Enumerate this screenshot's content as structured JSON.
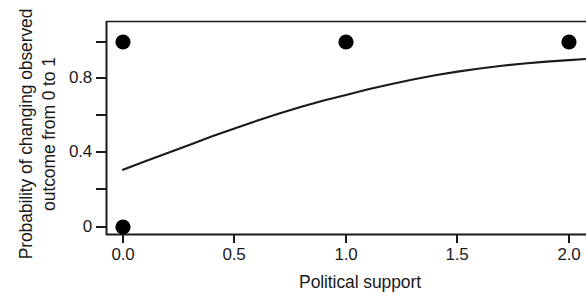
{
  "chart_data": {
    "type": "scatter",
    "title": "",
    "xlabel": "Political support",
    "ylabel": "Probability of changing observed outcome from 0 to 1",
    "ylabel_lines": [
      "Probability of changing observed",
      "outcome from 0 to 1"
    ],
    "xlim": [
      -0.05,
      2.12
    ],
    "ylim": [
      -0.03,
      1.04
    ],
    "xticks": [
      0.0,
      1.0,
      2.0
    ],
    "xtick_labels": [
      "0.0",
      "0.5",
      "1.0",
      "1.5",
      "2.0"
    ],
    "xtick_values": [
      0.0,
      0.5,
      1.0,
      1.5,
      2.0
    ],
    "ytick_values": [
      0,
      0.2,
      0.4,
      0.6,
      0.8,
      1.0
    ],
    "ytick_labels": [
      "0",
      "",
      "0.4",
      "",
      "0.8",
      ""
    ],
    "grid": false,
    "legend": null,
    "series": [
      {
        "name": "Observed outcomes",
        "type": "scatter",
        "marker": "filled-circle",
        "color": "#000000",
        "points": [
          {
            "x": 0.0,
            "y": 1.0
          },
          {
            "x": 0.0,
            "y": 0.0
          },
          {
            "x": 1.0,
            "y": 1.0
          },
          {
            "x": 2.0,
            "y": 1.0
          }
        ]
      },
      {
        "name": "Fitted probability curve",
        "type": "line",
        "color": "#1a1a1a",
        "points": [
          {
            "x": 0.0,
            "y": 0.31
          },
          {
            "x": 0.1,
            "y": 0.355
          },
          {
            "x": 0.2,
            "y": 0.4
          },
          {
            "x": 0.3,
            "y": 0.445
          },
          {
            "x": 0.4,
            "y": 0.49
          },
          {
            "x": 0.5,
            "y": 0.533
          },
          {
            "x": 0.6,
            "y": 0.574
          },
          {
            "x": 0.7,
            "y": 0.613
          },
          {
            "x": 0.8,
            "y": 0.65
          },
          {
            "x": 0.9,
            "y": 0.684
          },
          {
            "x": 1.0,
            "y": 0.714
          },
          {
            "x": 1.1,
            "y": 0.745
          },
          {
            "x": 1.2,
            "y": 0.772
          },
          {
            "x": 1.3,
            "y": 0.797
          },
          {
            "x": 1.4,
            "y": 0.82
          },
          {
            "x": 1.5,
            "y": 0.84
          },
          {
            "x": 1.6,
            "y": 0.857
          },
          {
            "x": 1.7,
            "y": 0.872
          },
          {
            "x": 1.8,
            "y": 0.884
          },
          {
            "x": 1.9,
            "y": 0.894
          },
          {
            "x": 2.0,
            "y": 0.902
          },
          {
            "x": 2.12,
            "y": 0.912
          }
        ]
      }
    ],
    "axis_color": "#1a1a1a",
    "background": "#ffffff"
  }
}
